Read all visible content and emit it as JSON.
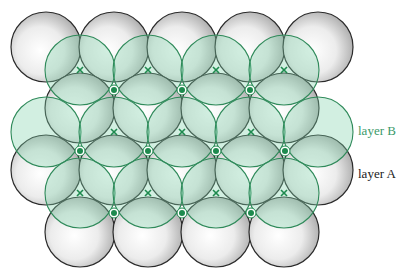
{
  "diagram": {
    "radius": 35,
    "colors": {
      "layer_a_stroke": "#2b2b2b",
      "layer_a_fill_center": "#ffffff",
      "layer_a_fill_edge": "#a9a9a9",
      "layer_b_stroke": "#2f8a5a",
      "layer_b_fill": "#7fd1a8",
      "marker_color": "#1e8a4e",
      "label_b_color": "#3a9a6a",
      "label_a_color": "#1a1a1a"
    },
    "layer_a": [
      {
        "x": 46,
        "y": 47
      },
      {
        "x": 114,
        "y": 47
      },
      {
        "x": 182,
        "y": 47
      },
      {
        "x": 250,
        "y": 47
      },
      {
        "x": 318,
        "y": 47
      },
      {
        "x": 80,
        "y": 108
      },
      {
        "x": 148,
        "y": 108
      },
      {
        "x": 216,
        "y": 108
      },
      {
        "x": 284,
        "y": 108
      },
      {
        "x": 46,
        "y": 170
      },
      {
        "x": 114,
        "y": 170
      },
      {
        "x": 182,
        "y": 170
      },
      {
        "x": 250,
        "y": 170
      },
      {
        "x": 318,
        "y": 170
      },
      {
        "x": 80,
        "y": 232
      },
      {
        "x": 148,
        "y": 232
      },
      {
        "x": 216,
        "y": 232
      },
      {
        "x": 284,
        "y": 232
      }
    ],
    "layer_b": [
      {
        "x": 80,
        "y": 70
      },
      {
        "x": 148,
        "y": 70
      },
      {
        "x": 216,
        "y": 70
      },
      {
        "x": 284,
        "y": 70
      },
      {
        "x": 46,
        "y": 132
      },
      {
        "x": 114,
        "y": 132
      },
      {
        "x": 182,
        "y": 132
      },
      {
        "x": 250,
        "y": 132
      },
      {
        "x": 318,
        "y": 132
      },
      {
        "x": 80,
        "y": 193
      },
      {
        "x": 148,
        "y": 193
      },
      {
        "x": 216,
        "y": 193
      },
      {
        "x": 284,
        "y": 193
      }
    ],
    "x_marks": [
      {
        "x": 80,
        "y": 70
      },
      {
        "x": 148,
        "y": 70
      },
      {
        "x": 216,
        "y": 70
      },
      {
        "x": 284,
        "y": 70
      },
      {
        "x": 114,
        "y": 132
      },
      {
        "x": 182,
        "y": 132
      },
      {
        "x": 251,
        "y": 132
      },
      {
        "x": 80,
        "y": 193
      },
      {
        "x": 148,
        "y": 193
      },
      {
        "x": 216,
        "y": 193
      },
      {
        "x": 284,
        "y": 193
      }
    ],
    "dot_marks": [
      {
        "x": 114,
        "y": 90
      },
      {
        "x": 182,
        "y": 90
      },
      {
        "x": 250,
        "y": 90
      },
      {
        "x": 80,
        "y": 151
      },
      {
        "x": 148,
        "y": 151
      },
      {
        "x": 216,
        "y": 151
      },
      {
        "x": 285,
        "y": 151
      },
      {
        "x": 114,
        "y": 213
      },
      {
        "x": 182,
        "y": 213
      },
      {
        "x": 251,
        "y": 213
      }
    ]
  },
  "labels": {
    "layer_b": "layer B",
    "layer_a": "layer A"
  }
}
